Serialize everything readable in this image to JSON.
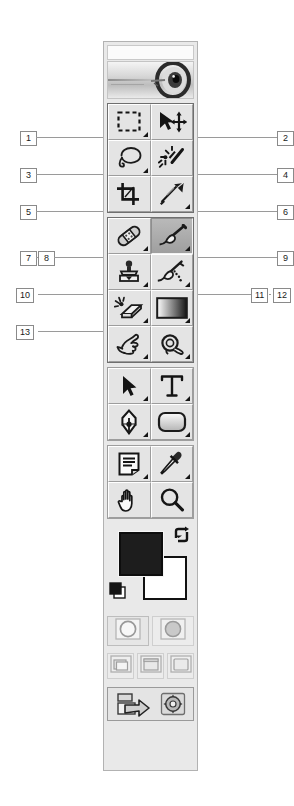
{
  "figure": {
    "callouts_left": [
      {
        "id": "1",
        "label": "1",
        "top": 131,
        "x": 20,
        "leader_from": 36,
        "leader_to": 103
      },
      {
        "id": "3",
        "label": "3",
        "top": 168,
        "x": 20,
        "leader_from": 36,
        "leader_to": 103
      },
      {
        "id": "5",
        "label": "5",
        "top": 205,
        "x": 20,
        "leader_from": 36,
        "leader_to": 103
      },
      {
        "id": "7",
        "label": "7",
        "top": 251,
        "x": 20,
        "leader_from": 36,
        "leader_to": 38
      },
      {
        "id": "8",
        "label": "8",
        "top": 251,
        "x": 38,
        "leader_from": 54,
        "leader_to": 103
      },
      {
        "id": "10",
        "label": "10",
        "top": 288,
        "x": 16,
        "leader_from": 38,
        "leader_to": 103
      },
      {
        "id": "13",
        "label": "13",
        "top": 325,
        "x": 16,
        "leader_from": 38,
        "leader_to": 103
      }
    ],
    "callouts_right": [
      {
        "id": "2",
        "label": "2",
        "top": 131,
        "x": 277,
        "leader_from": 198,
        "leader_to": 277
      },
      {
        "id": "4",
        "label": "4",
        "top": 168,
        "x": 277,
        "leader_from": 198,
        "leader_to": 277
      },
      {
        "id": "6",
        "label": "6",
        "top": 205,
        "x": 277,
        "leader_from": 198,
        "leader_to": 277
      },
      {
        "id": "9",
        "label": "9",
        "top": 251,
        "x": 277,
        "leader_from": 198,
        "leader_to": 277
      },
      {
        "id": "11",
        "label": "11",
        "top": 288,
        "x": 251,
        "leader_from": 198,
        "leader_to": 251
      },
      {
        "id": "12",
        "label": "12",
        "top": 288,
        "x": 273,
        "leader_from": 269,
        "leader_to": 271
      }
    ]
  },
  "toolbox": {
    "titlebar": "",
    "banner_alt": "photoshop-eye-banner",
    "groups": [
      {
        "name": "selection-tools",
        "cells": [
          {
            "icon": "rectangular-marquee-icon",
            "name": "rectangular-marquee-tool",
            "has_flyout": true,
            "selected": false
          },
          {
            "icon": "move-icon",
            "name": "move-tool",
            "has_flyout": false,
            "selected": false
          },
          {
            "icon": "lasso-icon",
            "name": "lasso-tool",
            "has_flyout": true,
            "selected": false
          },
          {
            "icon": "magic-wand-icon",
            "name": "magic-wand-tool",
            "has_flyout": false,
            "selected": false
          },
          {
            "icon": "crop-icon",
            "name": "crop-tool",
            "has_flyout": false,
            "selected": false
          },
          {
            "icon": "slice-icon",
            "name": "slice-tool",
            "has_flyout": true,
            "selected": false
          }
        ]
      },
      {
        "name": "retouch-paint-tools",
        "cells": [
          {
            "icon": "healing-brush-icon",
            "name": "healing-brush-tool",
            "has_flyout": true,
            "selected": false
          },
          {
            "icon": "paintbrush-icon",
            "name": "paintbrush-tool",
            "has_flyout": true,
            "selected": true
          },
          {
            "icon": "clone-stamp-icon",
            "name": "clone-stamp-tool",
            "has_flyout": true,
            "selected": false
          },
          {
            "icon": "history-brush-icon",
            "name": "history-brush-tool",
            "has_flyout": true,
            "selected": false
          },
          {
            "icon": "eraser-icon",
            "name": "eraser-tool",
            "has_flyout": true,
            "selected": false
          },
          {
            "icon": "gradient-icon",
            "name": "gradient-tool",
            "has_flyout": true,
            "selected": false
          },
          {
            "icon": "blur-icon",
            "name": "blur-tool",
            "has_flyout": true,
            "selected": false
          },
          {
            "icon": "dodge-icon",
            "name": "dodge-tool",
            "has_flyout": true,
            "selected": false
          }
        ]
      },
      {
        "name": "vector-type-tools",
        "cells": [
          {
            "icon": "path-selection-icon",
            "name": "path-selection-tool",
            "has_flyout": true,
            "selected": false
          },
          {
            "icon": "type-icon",
            "name": "type-tool",
            "has_flyout": true,
            "selected": false
          },
          {
            "icon": "pen-icon",
            "name": "pen-tool",
            "has_flyout": true,
            "selected": false
          },
          {
            "icon": "shape-icon",
            "name": "rectangle-shape-tool",
            "has_flyout": true,
            "selected": false
          }
        ]
      },
      {
        "name": "utility-tools",
        "cells": [
          {
            "icon": "notes-icon",
            "name": "notes-tool",
            "has_flyout": true,
            "selected": false
          },
          {
            "icon": "eyedropper-icon",
            "name": "eyedropper-tool",
            "has_flyout": true,
            "selected": false
          },
          {
            "icon": "hand-icon",
            "name": "hand-tool",
            "has_flyout": false,
            "selected": false
          },
          {
            "icon": "zoom-icon",
            "name": "zoom-tool",
            "has_flyout": false,
            "selected": false
          }
        ]
      }
    ],
    "colors": {
      "foreground": "#1d1d1d",
      "background": "#ffffff",
      "swap_icon": "swap-colors-icon",
      "default_icon": "default-colors-icon"
    },
    "quickmask": [
      {
        "name": "standard-mode-button",
        "icon": "standard-mode-icon",
        "active": true
      },
      {
        "name": "quick-mask-mode-button",
        "icon": "quick-mask-mode-icon",
        "active": false
      }
    ],
    "screenmodes": [
      {
        "name": "standard-screen-mode-button",
        "icon": "standard-screen-icon",
        "active": true
      },
      {
        "name": "full-screen-menubar-mode-button",
        "icon": "full-screen-menubar-icon",
        "active": false
      },
      {
        "name": "full-screen-mode-button",
        "icon": "full-screen-icon",
        "active": false
      }
    ],
    "jump": {
      "name": "jump-to-imageready-button",
      "icon": "jump-to-imageready-icon",
      "label": ""
    }
  }
}
